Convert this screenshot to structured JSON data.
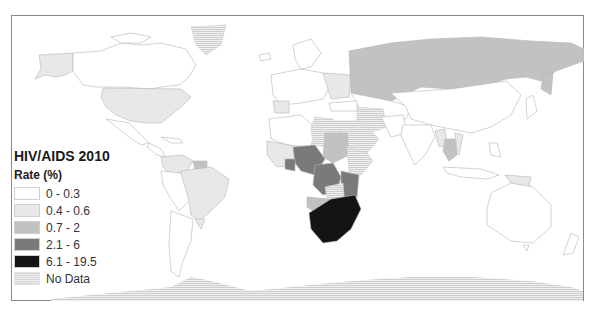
{
  "map": {
    "title": "HIV/AIDS 2010",
    "subtitle": "Rate (%)",
    "projection": "world choropleth",
    "legend": [
      {
        "label": "0 - 0.3",
        "color": "#ffffff",
        "pattern": "solid"
      },
      {
        "label": "0.4 - 0.6",
        "color": "#e8e8e8",
        "pattern": "solid"
      },
      {
        "label": "0.7 - 2",
        "color": "#c2c2c2",
        "pattern": "solid"
      },
      {
        "label": "2.1 - 6",
        "color": "#7a7a7a",
        "pattern": "solid"
      },
      {
        "label": "6.1 - 19.5",
        "color": "#141414",
        "pattern": "solid"
      },
      {
        "label": "No Data",
        "color": "#dcdcdc",
        "pattern": "horizontal-hatch"
      }
    ],
    "colors": {
      "frame_border": "#8a8a8a",
      "country_outline": "#b8b8b8",
      "ocean": "#ffffff"
    }
  }
}
